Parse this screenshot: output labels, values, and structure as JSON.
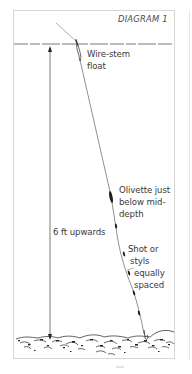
{
  "diagram": {
    "title": "DIAGRAM 1",
    "labels": {
      "float": [
        "Wire-stem",
        "float"
      ],
      "olivette": [
        "Olivette just",
        "below mid-",
        "depth"
      ],
      "depth": "6 ft upwards",
      "shot": [
        "Shot or",
        "styls",
        "equally",
        "spaced"
      ]
    },
    "elements": {
      "water_surface": "dashed-line",
      "rod_line": "line",
      "float": "wire-stem-float",
      "olivette": "olivette-weight",
      "shots": 5,
      "hook": "hook",
      "bed": "gravel-riverbed"
    },
    "colors": {
      "ink": "#2a2a2a",
      "frame": "#d6d6d6",
      "background": "#ffffff"
    }
  }
}
